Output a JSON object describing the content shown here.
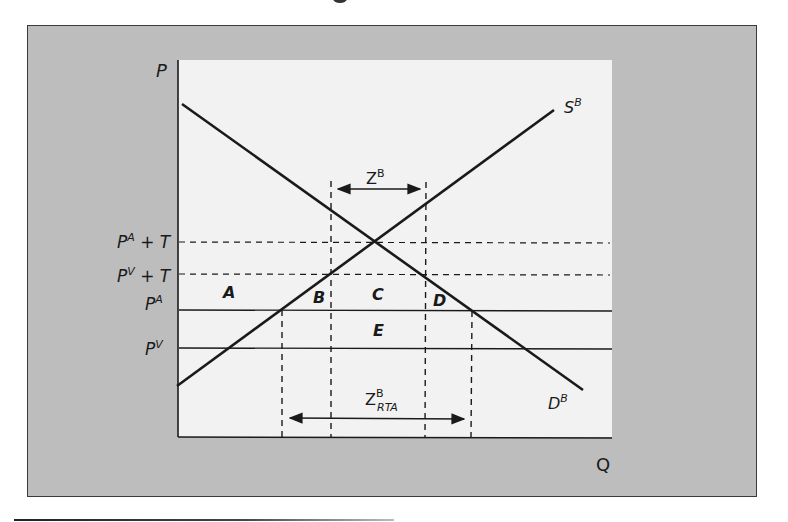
{
  "diagram": {
    "type": "supply-demand",
    "axes": {
      "y_label": "P",
      "x_label": "Q"
    },
    "curves": {
      "supply": {
        "label": "S",
        "superscript": "B"
      },
      "demand": {
        "label": "D",
        "superscript": "B"
      }
    },
    "price_levels": [
      {
        "label": "P",
        "sup": "A",
        "suffix": " + T",
        "style": "dashed"
      },
      {
        "label": "P",
        "sup": "V",
        "suffix": " + T",
        "style": "dashed"
      },
      {
        "label": "P",
        "sup": "A",
        "suffix": "",
        "style": "solid"
      },
      {
        "label": "P",
        "sup": "V",
        "suffix": "",
        "style": "solid"
      }
    ],
    "regions": [
      "A",
      "B",
      "C",
      "D",
      "E"
    ],
    "arrows": {
      "top": {
        "label": "Z",
        "sup": "B",
        "sub": ""
      },
      "bottom": {
        "label": "Z",
        "sup": "B",
        "sub": "RTA"
      }
    },
    "colors": {
      "frame": "#bdbdbd",
      "plot_bg": "#f2f2f2",
      "line": "#1a1a1a"
    }
  }
}
